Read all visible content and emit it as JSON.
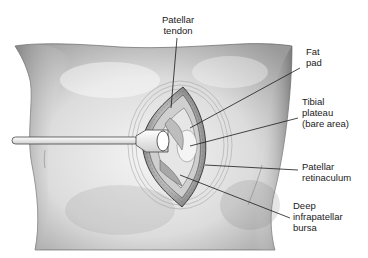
{
  "diagram": {
    "labels": [
      {
        "id": "patellar-tendon",
        "text": "Patellar\ntendon",
        "x": 158,
        "y": 14,
        "align": "center"
      },
      {
        "id": "fat-pad",
        "text": "Fat\npad",
        "x": 306,
        "y": 46,
        "align": "left"
      },
      {
        "id": "tibial-plateau",
        "text": "Tibial\nplateau\n(bare area)",
        "x": 302,
        "y": 96,
        "align": "left"
      },
      {
        "id": "patellar-retinaculum",
        "text": "Patellar\nretinaculum",
        "x": 302,
        "y": 161,
        "align": "left"
      },
      {
        "id": "deep-infrapatellar-bursa",
        "text": "Deep\ninfrapatellar\nbursa",
        "x": 293,
        "y": 200,
        "align": "left"
      }
    ],
    "leader_lines": [
      {
        "to": "patellar-tendon",
        "x1": 177,
        "y1": 38,
        "x2": 171,
        "y2": 108
      },
      {
        "to": "fat-pad",
        "x1": 300,
        "y1": 68,
        "x2": 190,
        "y2": 128
      },
      {
        "to": "tibial-plateau",
        "x1": 298,
        "y1": 118,
        "x2": 190,
        "y2": 146
      },
      {
        "to": "patellar-retinaculum",
        "x1": 298,
        "y1": 170,
        "x2": 205,
        "y2": 165
      },
      {
        "to": "deep-infrapatellar-bursa",
        "x1": 290,
        "y1": 218,
        "x2": 180,
        "y2": 175
      }
    ],
    "colors": {
      "skin_light": "#f2f2f2",
      "skin_mid": "#c9c9c9",
      "skin_dark": "#8a8a8a",
      "outline": "#333333",
      "line": "#1a1a1a"
    }
  }
}
